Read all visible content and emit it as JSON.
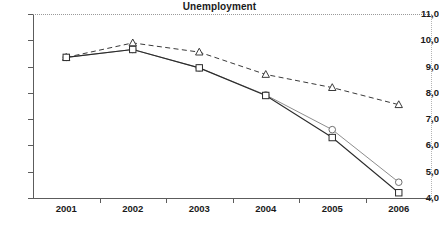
{
  "chart_data": {
    "type": "line",
    "title": "Unemployment",
    "xlabel": "",
    "ylabel": "",
    "categories": [
      "2001",
      "2002",
      "2003",
      "2004",
      "2005",
      "2006"
    ],
    "ylim": [
      4.0,
      11.0
    ],
    "ytick_labels": [
      "11,0",
      "10,0",
      "9,0",
      "8,0",
      "7,0",
      "6,0",
      "5,0",
      "4,0"
    ],
    "ytick_values": [
      11.0,
      10.0,
      9.0,
      8.0,
      7.0,
      6.0,
      5.0,
      4.0
    ],
    "decimal_separator": ",",
    "grid": false,
    "legend": "none",
    "series": [
      {
        "name": "triangle-dashed-series",
        "marker": "triangle",
        "line_style": "dashed",
        "color": "#3a3a3a",
        "values": [
          9.35,
          9.9,
          9.55,
          8.7,
          8.2,
          7.55
        ]
      },
      {
        "name": "square-solid-series",
        "marker": "square",
        "line_style": "solid",
        "color": "#2b2b2b",
        "values": [
          9.35,
          9.65,
          8.95,
          7.9,
          6.3,
          4.2
        ]
      },
      {
        "name": "circle-solid-series",
        "marker": "circle",
        "line_style": "solid",
        "color": "#8d8d8d",
        "values": [
          9.35,
          9.65,
          8.95,
          7.92,
          6.6,
          4.6
        ]
      }
    ]
  }
}
